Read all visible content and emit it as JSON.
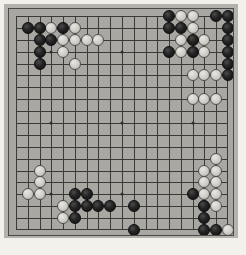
{
  "page": {
    "background_color": "#f2f1ec"
  },
  "board": {
    "name": "go-board",
    "size": 19,
    "board_color": "#a9a7a2",
    "line_color": "#3a3a38",
    "border_color": "#4a4a48",
    "black_color": "#1a1a1a",
    "white_color": "#d2d1cc",
    "star_points": [
      [
        3,
        3
      ],
      [
        9,
        3
      ],
      [
        15,
        3
      ],
      [
        3,
        9
      ],
      [
        9,
        9
      ],
      [
        15,
        9
      ],
      [
        3,
        15
      ],
      [
        9,
        15
      ],
      [
        15,
        15
      ]
    ]
  },
  "caption": {
    "text": ""
  },
  "stones": {
    "black": [
      [
        1,
        1
      ],
      [
        2,
        1
      ],
      [
        4,
        1
      ],
      [
        2,
        2
      ],
      [
        3,
        2
      ],
      [
        2,
        3
      ],
      [
        2,
        4
      ],
      [
        13,
        0
      ],
      [
        17,
        0
      ],
      [
        18,
        0
      ],
      [
        13,
        1
      ],
      [
        14,
        1
      ],
      [
        18,
        1
      ],
      [
        15,
        2
      ],
      [
        18,
        2
      ],
      [
        13,
        3
      ],
      [
        15,
        3
      ],
      [
        18,
        3
      ],
      [
        18,
        4
      ],
      [
        18,
        5
      ],
      [
        19,
        5
      ],
      [
        10,
        16
      ],
      [
        15,
        15
      ],
      [
        16,
        16
      ],
      [
        16,
        17
      ],
      [
        10,
        18
      ],
      [
        16,
        18
      ],
      [
        17,
        18
      ],
      [
        5,
        15
      ],
      [
        6,
        15
      ],
      [
        5,
        16
      ],
      [
        6,
        16
      ],
      [
        7,
        16
      ],
      [
        8,
        16
      ],
      [
        5,
        17
      ]
    ],
    "white": [
      [
        3,
        1
      ],
      [
        5,
        1
      ],
      [
        4,
        2
      ],
      [
        5,
        2
      ],
      [
        6,
        2
      ],
      [
        7,
        2
      ],
      [
        4,
        3
      ],
      [
        5,
        4
      ],
      [
        14,
        0
      ],
      [
        15,
        0
      ],
      [
        15,
        1
      ],
      [
        14,
        2
      ],
      [
        16,
        2
      ],
      [
        14,
        3
      ],
      [
        16,
        3
      ],
      [
        15,
        5
      ],
      [
        16,
        5
      ],
      [
        17,
        5
      ],
      [
        15,
        7
      ],
      [
        16,
        7
      ],
      [
        17,
        7
      ],
      [
        17,
        12
      ],
      [
        16,
        13
      ],
      [
        17,
        13
      ],
      [
        16,
        14
      ],
      [
        17,
        14
      ],
      [
        16,
        15
      ],
      [
        17,
        15
      ],
      [
        16,
        16
      ],
      [
        17,
        16
      ],
      [
        18,
        18
      ],
      [
        2,
        13
      ],
      [
        2,
        14
      ],
      [
        1,
        15
      ],
      [
        2,
        15
      ],
      [
        4,
        16
      ],
      [
        4,
        17
      ]
    ]
  }
}
